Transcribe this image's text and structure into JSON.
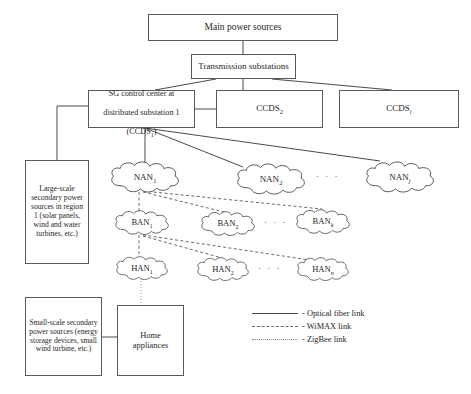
{
  "figure": {
    "background": "#ffffff",
    "line_color": "#4a4a4a",
    "text_color": "#262626"
  },
  "boxes": {
    "main_power": "Main power sources",
    "transmission": "Transmission substations",
    "sg_control_line1": "SG control center at",
    "sg_control_line2": "distributed substation 1",
    "sg_control_line3_pre": "(CCDS",
    "sg_control_line3_sub": "1",
    "sg_control_line3_post": ")",
    "ccds2_pre": "CCDS",
    "ccds2_sub": "2",
    "ccdsi_pre": "CCDS",
    "ccdsi_sub": "i",
    "large_scale": "Large-scale secondary power sources in region 1 (solar panels, wind and water turbines, etc.)",
    "small_scale": "Small-scale secondary power sources (energy storage devices, small wind turbine, etc.)",
    "home_appliances": "Home\nappliances"
  },
  "clouds": {
    "nan1": {
      "name": "NAN",
      "sub": "1",
      "italic_sub": false
    },
    "nan2": {
      "name": "NAN",
      "sub": "2",
      "italic_sub": false
    },
    "nanj": {
      "name": "NAN",
      "sub": "j",
      "italic_sub": true
    },
    "ban1": {
      "name": "BAN",
      "sub": "1",
      "italic_sub": false
    },
    "ban2": {
      "name": "BAN",
      "sub": "2",
      "italic_sub": false
    },
    "bank": {
      "name": "BAN",
      "sub": "k",
      "italic_sub": true
    },
    "han1": {
      "name": "HAN",
      "sub": "1",
      "italic_sub": false
    },
    "han2": {
      "name": "HAN",
      "sub": "2",
      "italic_sub": false
    },
    "hann": {
      "name": "HAN",
      "sub": "n",
      "italic_sub": true
    }
  },
  "ellipses": {
    "nan_row": "· · ·",
    "ban_row": "· · ·",
    "han_row": "· · ·"
  },
  "legend": {
    "items": [
      {
        "style": "solid",
        "label": "- Optical fiber link"
      },
      {
        "style": "dashed",
        "label": "- WiMAX link"
      },
      {
        "style": "dotted",
        "label": "- ZigBee link"
      }
    ]
  }
}
